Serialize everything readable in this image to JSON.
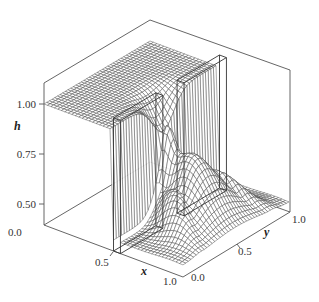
{
  "chart_data": {
    "type": "surface",
    "title": "",
    "xlabel": "x",
    "ylabel": "y",
    "zlabel": "h",
    "xlim": [
      0.0,
      1.0
    ],
    "ylim": [
      0.0,
      1.0
    ],
    "zlim": [
      0.4,
      1.1
    ],
    "x_ticks": [
      "0.0",
      "0.5",
      "1.0"
    ],
    "y_ticks": [
      "0.0",
      "0.5",
      "1.0"
    ],
    "z_ticks": [
      "0.50",
      "0.75",
      "1.00"
    ],
    "grid_resolution": 40,
    "upstream_level": 1.0,
    "downstream_level": 0.45,
    "obstacles": [
      {
        "name": "left-wall-block",
        "x": [
          0.5,
          0.55
        ],
        "y": [
          0.0,
          0.4
        ]
      },
      {
        "name": "right-wall-block",
        "x": [
          0.5,
          0.55
        ],
        "y": [
          0.6,
          1.0
        ]
      }
    ]
  },
  "axes": {
    "z_ticks": [
      {
        "label": "1.00",
        "value": 1.0
      },
      {
        "label": "0.75",
        "value": 0.75
      },
      {
        "label": "0.50",
        "value": 0.5
      }
    ],
    "x_ticks": [
      {
        "label": "0.0",
        "value": 0.0
      },
      {
        "label": "0.5",
        "value": 0.5
      },
      {
        "label": "1.0",
        "value": 1.0
      }
    ],
    "y_ticks": [
      {
        "label": "0.0",
        "value": 0.0
      },
      {
        "label": "0.5",
        "value": 0.5
      },
      {
        "label": "1.0",
        "value": 1.0
      }
    ],
    "x_label": "x",
    "y_label": "y",
    "z_label": "h"
  }
}
